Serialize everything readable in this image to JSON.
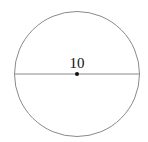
{
  "diagram": {
    "type": "circle-with-diameter",
    "center": {
      "x": 77,
      "y": 74
    },
    "radius": 62.5,
    "diameter_label": "10",
    "colors": {
      "circle_stroke": "#8a8a8a",
      "diameter_stroke": "#8a8a8a",
      "center_dot": "#111111",
      "label": "#111111"
    }
  }
}
